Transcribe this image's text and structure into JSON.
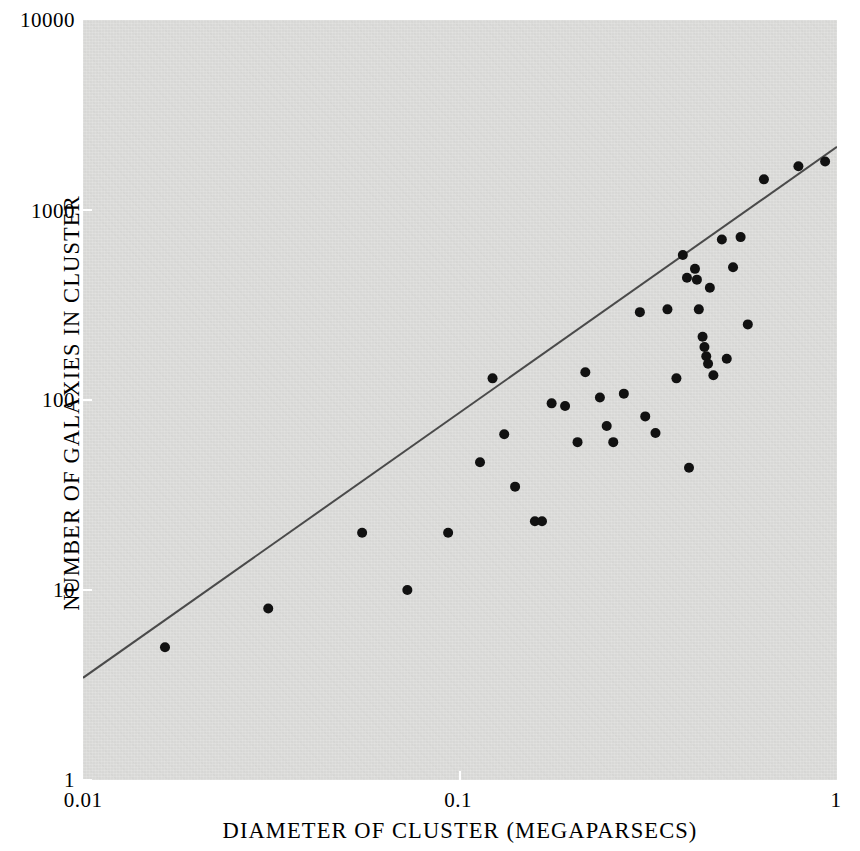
{
  "figure": {
    "background_color": "#ffffff",
    "panel_color": "#dcdcda",
    "ink_color": "#151515"
  },
  "axes": {
    "x_title": "DIAMETER OF CLUSTER (MEGAPARSECS)",
    "y_title": "NUMBER OF GALAXIES IN CLUSTER",
    "x_ticks": [
      "0.01",
      "0.1",
      "1"
    ],
    "y_ticks": [
      "10000",
      "1000",
      "100",
      "10",
      "1"
    ]
  },
  "chart_data": {
    "type": "scatter",
    "title": "",
    "subtitle": "",
    "xlabel": "DIAMETER OF CLUSTER (MEGAPARSECS)",
    "ylabel": "NUMBER OF GALAXIES IN CLUSTER",
    "xscale": "log",
    "yscale": "log",
    "xlim": [
      0.01,
      1
    ],
    "ylim": [
      1,
      10000
    ],
    "xticks": [
      0.01,
      0.1,
      1
    ],
    "xticklabels": [
      "0.01",
      "0.1",
      "1"
    ],
    "yticks": [
      1,
      10,
      100,
      1000,
      10000
    ],
    "yticklabels": [
      "1",
      "10",
      "100",
      "1000",
      "10000"
    ],
    "grid": false,
    "legend": null,
    "marker": "filled-circle",
    "marker_color": "#111111",
    "marker_size_px": 10,
    "series": [
      {
        "name": "Clusters of galaxies",
        "type": "scatter",
        "points": [
          [
            0.0165,
            5.0
          ],
          [
            0.031,
            8.0
          ],
          [
            0.055,
            20.0
          ],
          [
            0.0725,
            10.0
          ],
          [
            0.093,
            20.0
          ],
          [
            0.113,
            47.0
          ],
          [
            0.122,
            130.0
          ],
          [
            0.131,
            66.0
          ],
          [
            0.14,
            35.0
          ],
          [
            0.158,
            23.0
          ],
          [
            0.165,
            23.0
          ],
          [
            0.175,
            96.0
          ],
          [
            0.19,
            93.0
          ],
          [
            0.205,
            60.0
          ],
          [
            0.215,
            140.0
          ],
          [
            0.235,
            103.0
          ],
          [
            0.245,
            73.0
          ],
          [
            0.255,
            60.0
          ],
          [
            0.272,
            108.0
          ],
          [
            0.3,
            290.0
          ],
          [
            0.31,
            82.0
          ],
          [
            0.33,
            67.0
          ],
          [
            0.355,
            300.0
          ],
          [
            0.375,
            130.0
          ],
          [
            0.39,
            580.0
          ],
          [
            0.4,
            440.0
          ],
          [
            0.405,
            44.0
          ],
          [
            0.42,
            490.0
          ],
          [
            0.425,
            430.0
          ],
          [
            0.43,
            300.0
          ],
          [
            0.44,
            215.0
          ],
          [
            0.445,
            190.0
          ],
          [
            0.45,
            170.0
          ],
          [
            0.455,
            155.0
          ],
          [
            0.46,
            390.0
          ],
          [
            0.47,
            135.0
          ],
          [
            0.495,
            700.0
          ],
          [
            0.51,
            165.0
          ],
          [
            0.53,
            500.0
          ],
          [
            0.555,
            720.0
          ],
          [
            0.58,
            250.0
          ],
          [
            0.64,
            1450.0
          ],
          [
            0.79,
            1700.0
          ],
          [
            0.93,
            1800.0
          ]
        ]
      },
      {
        "name": "Reference line",
        "type": "line",
        "points": [
          [
            0.01,
            3.45
          ],
          [
            1.0,
            2150.0
          ]
        ],
        "color": "#4a4a4a",
        "width_px": 2
      }
    ]
  }
}
